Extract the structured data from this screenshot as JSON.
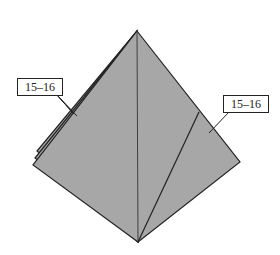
{
  "diagram": {
    "colors": {
      "paper_fill": "#a7a7a7",
      "edge_stroke": "#222222",
      "background": "#ffffff"
    },
    "shape": {
      "apex": [
        137,
        31
      ],
      "bottom": [
        138,
        242
      ],
      "right_corner": [
        240,
        162
      ],
      "left_corners": [
        [
          37,
          151
        ],
        [
          35,
          158
        ],
        [
          33,
          165
        ]
      ],
      "center_crease": [
        [
          137,
          31
        ],
        [
          138,
          242
        ]
      ],
      "right_crease": [
        [
          199,
          112
        ],
        [
          138,
          242
        ]
      ]
    },
    "labels": [
      {
        "id": "left",
        "text": "15–16",
        "box": [
          17,
          78,
          44,
          16
        ],
        "leader_targets": [
          [
            72,
            112
          ],
          [
            74,
            114
          ],
          [
            77,
            116
          ]
        ]
      },
      {
        "id": "right",
        "text": "15–16",
        "box": [
          223,
          95,
          44,
          16
        ],
        "leader_targets": [
          [
            209,
            133
          ]
        ]
      }
    ]
  }
}
